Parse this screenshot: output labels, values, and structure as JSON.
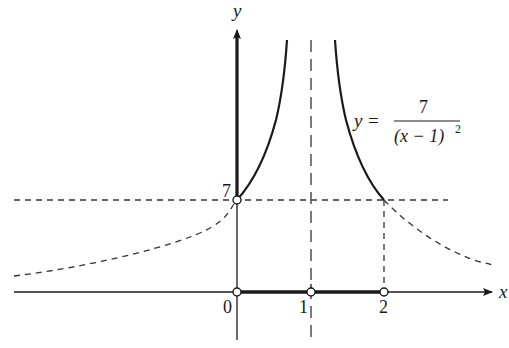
{
  "figure": {
    "type": "function-graph",
    "function_label": {
      "lhs": "y",
      "equals": "=",
      "numerator": "7",
      "denominator_base": "(x − 1)",
      "denominator_exp": "2"
    },
    "axes": {
      "x_label": "x",
      "y_label": "y"
    },
    "tick_labels": {
      "x": [
        "0",
        "1",
        "2"
      ],
      "y": [
        "7"
      ]
    },
    "asymptote": "x = 1",
    "horizontal_reference": "y = 7",
    "solution_interval": "[0, 1) ∪ (1, 2]",
    "open_points": [
      {
        "x": 0,
        "y": 0
      },
      {
        "x": 1,
        "y": 0
      },
      {
        "x": 2,
        "y": 0
      },
      {
        "x": 0,
        "y": 7
      }
    ],
    "colors": {
      "ink": "#1a1a1a",
      "background": "#ffffff"
    }
  }
}
